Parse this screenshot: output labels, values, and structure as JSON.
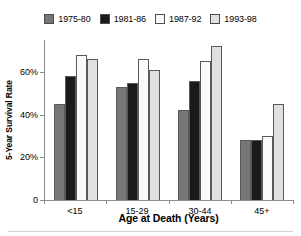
{
  "chart_data": {
    "type": "bar",
    "title": "",
    "xlabel": "Age at Death (Years)",
    "ylabel": "5-Year Survival Rate",
    "categories": [
      "<15",
      "15-29",
      "30-44",
      "45+"
    ],
    "series": [
      {
        "name": "1975-80",
        "color": "#777777",
        "values": [
          45,
          53,
          42,
          28
        ]
      },
      {
        "name": "1981-86",
        "color": "#1a1a1a",
        "values": [
          58,
          55,
          56,
          28
        ]
      },
      {
        "name": "1987-92",
        "color": "#fafafa",
        "values": [
          68,
          66,
          65,
          30
        ]
      },
      {
        "name": "1993-98",
        "color": "#e0e0e0",
        "values": [
          66,
          61,
          72,
          45
        ]
      }
    ],
    "ylim": [
      0,
      75
    ],
    "y_ticks": [
      0,
      20,
      40,
      60
    ],
    "y_tick_labels": [
      "0",
      "20%",
      "40%",
      "60%"
    ],
    "grid": false,
    "legend_position": "top"
  },
  "legend": {
    "items": [
      {
        "label": "1975-80"
      },
      {
        "label": "1981-86"
      },
      {
        "label": "1987-92"
      },
      {
        "label": "1993-98"
      }
    ]
  },
  "axes": {
    "y_title": "5-Year Survival Rate",
    "x_title": "Age at Death (Years)"
  }
}
